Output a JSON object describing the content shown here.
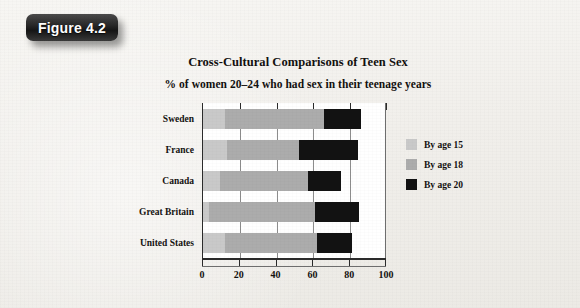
{
  "figure": {
    "badge_label": "Figure 4.2"
  },
  "chart_data": {
    "type": "bar",
    "orientation": "horizontal",
    "stacked": true,
    "title": "Cross-Cultural Comparisons of Teen Sex",
    "subtitle": "% of women 20–24 who had sex in their teenage years",
    "xlabel": "",
    "ylabel": "",
    "categories": [
      "Sweden",
      "France",
      "Canada",
      "Great Britain",
      "United States"
    ],
    "xlim": [
      0,
      100
    ],
    "xticks": [
      0,
      20,
      40,
      60,
      80,
      100
    ],
    "xtick_labels": [
      "0",
      "20",
      "40",
      "60",
      "80",
      "100"
    ],
    "grid": true,
    "legend_position": "right",
    "series": [
      {
        "name": "By age 15",
        "color": "#c9c9c9",
        "values": [
          12,
          13,
          9,
          3,
          12
        ]
      },
      {
        "name": "By age 18",
        "color": "#acacac",
        "values": [
          66,
          52,
          57,
          61,
          62
        ]
      },
      {
        "name": "By age 20",
        "color": "#121212",
        "values": [
          86,
          84,
          75,
          85,
          81
        ]
      }
    ],
    "legend": [
      {
        "label": "By age 15",
        "color": "#c9c9c9"
      },
      {
        "label": "By age 18",
        "color": "#acacac"
      },
      {
        "label": "By age 20",
        "color": "#121212"
      }
    ]
  }
}
